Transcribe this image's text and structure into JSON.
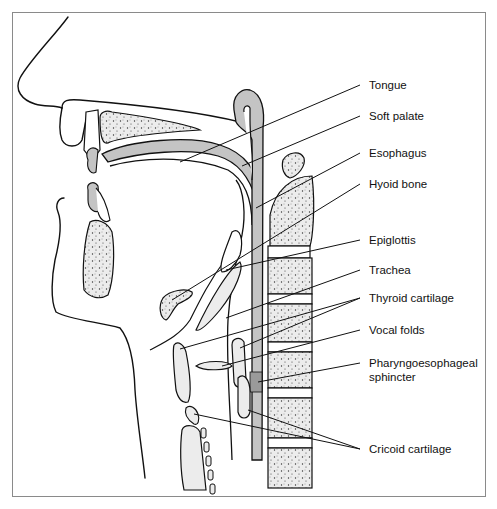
{
  "figure": {
    "labels": [
      {
        "id": "tongue",
        "text": "Tongue",
        "y": 78
      },
      {
        "id": "soft-palate",
        "text": "Soft palate",
        "y": 109
      },
      {
        "id": "esophagus",
        "text": "Esophagus",
        "y": 146
      },
      {
        "id": "hyoid-bone",
        "text": "Hyoid bone",
        "y": 177
      },
      {
        "id": "epiglottis",
        "text": "Epiglottis",
        "y": 233
      },
      {
        "id": "trachea",
        "text": "Trachea",
        "y": 263
      },
      {
        "id": "thyroid-cartilage",
        "text": "Thyroid cartilage",
        "y": 291
      },
      {
        "id": "vocal-folds",
        "text": "Vocal folds",
        "y": 323
      },
      {
        "id": "pharyngoesophageal-sphincter-1",
        "text": "Pharyngoesophageal",
        "y": 356
      },
      {
        "id": "pharyngoesophageal-sphincter-2",
        "text": "sphincter",
        "y": 370
      },
      {
        "id": "cricoid-cartilage",
        "text": "Cricoid cartilage",
        "y": 442
      }
    ],
    "colors": {
      "line": "#111111",
      "soft_tissue_gray": "#c4c4c4",
      "bone_fill": "#ececec",
      "frame": "#8a8a8a"
    }
  }
}
